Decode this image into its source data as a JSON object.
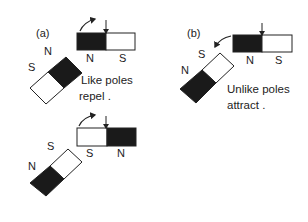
{
  "panels": {
    "a": {
      "label": "(a)",
      "caption_line1": "Like poles",
      "caption_line2": "repel .",
      "top": {
        "fixed_magnet": {
          "left_pole": "N",
          "right_pole": "S"
        },
        "tilted_magnet": {
          "upper_pole": "N",
          "lower_pole": "S"
        }
      },
      "bottom": {
        "fixed_magnet": {
          "left_pole": "S",
          "right_pole": "N"
        },
        "tilted_magnet": {
          "upper_pole": "S",
          "lower_pole": "N"
        }
      }
    },
    "b": {
      "label": "(b)",
      "caption_line1": "Unlike poles",
      "caption_line2": "attract .",
      "fixed_magnet": {
        "left_pole": "N",
        "right_pole": "S"
      },
      "tilted_magnet": {
        "upper_pole": "S",
        "lower_pole": "N"
      }
    }
  },
  "colors": {
    "north_fill": "#1a1a1a",
    "south_fill": "#ffffff",
    "stroke": "#222222"
  }
}
